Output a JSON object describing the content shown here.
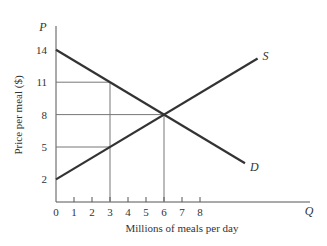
{
  "chart_data": {
    "type": "line",
    "title": "",
    "xlabel": "Millions of meals per day",
    "ylabel": "Price per meal ($)",
    "x_axis_symbol": "Q",
    "y_axis_symbol": "P",
    "x_ticks": [
      "0",
      "1",
      "2",
      "3",
      "4",
      "5",
      "6",
      "7",
      "8"
    ],
    "y_ticks": [
      "2",
      "5",
      "8",
      "11",
      "14"
    ],
    "xlim": [
      0,
      11.5
    ],
    "ylim": [
      0,
      15
    ],
    "grid": false,
    "series": [
      {
        "name": "S",
        "label": "S",
        "points": [
          [
            0,
            2
          ],
          [
            11.2,
            13.2
          ]
        ],
        "description": "Supply: P = 2 + Q"
      },
      {
        "name": "D",
        "label": "D",
        "points": [
          [
            0,
            14
          ],
          [
            10.5,
            3.5
          ]
        ],
        "description": "Demand: P = 14 - Q"
      }
    ],
    "reference_lines": [
      {
        "from": [
          0,
          11
        ],
        "to": [
          3,
          11
        ]
      },
      {
        "from": [
          3,
          11
        ],
        "to": [
          3,
          0
        ]
      },
      {
        "from": [
          0,
          8
        ],
        "to": [
          6,
          8
        ]
      },
      {
        "from": [
          6,
          8
        ],
        "to": [
          6,
          0
        ]
      },
      {
        "from": [
          0,
          5
        ],
        "to": [
          3,
          5
        ]
      }
    ],
    "equilibrium": {
      "Q": 6,
      "P": 8
    }
  }
}
